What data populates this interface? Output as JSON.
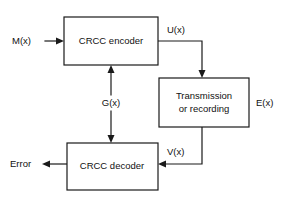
{
  "diagram": {
    "stroke_color": "#1a1a1a",
    "text_color": "#111111",
    "background_color": "#ffffff",
    "blocks": [
      {
        "id": "encoder",
        "label": "CRCC encoder"
      },
      {
        "id": "channel",
        "label_line1": "Transmission",
        "label_line2": "or recording"
      },
      {
        "id": "decoder",
        "label": "CRCC decoder"
      }
    ],
    "signals": {
      "input": "M(x)",
      "encoded": "U(x)",
      "generator": "G(x)",
      "error": "E(x)",
      "received": "V(x)",
      "output": "Error"
    }
  }
}
